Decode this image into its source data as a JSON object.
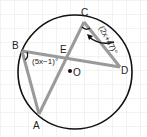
{
  "diagram": {
    "type": "circle-geometry",
    "points": {
      "A": "A",
      "B": "B",
      "C": "C",
      "D": "D",
      "E": "E",
      "O": "O"
    },
    "angles": {
      "angle_B": "(5x−1)°",
      "angle_C": "(2x+47)°"
    },
    "colors": {
      "circle": "#111111",
      "chords": "#9a9a9a",
      "text": "#222222"
    }
  }
}
